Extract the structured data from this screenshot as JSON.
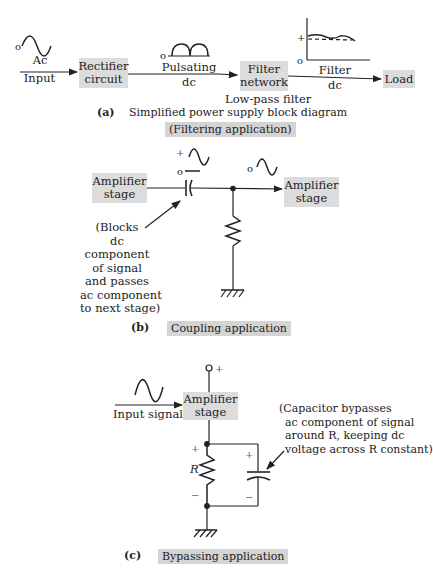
{
  "panel_a": {
    "input_label_1": "Ac",
    "input_label_2": "Input",
    "rectifier_1": "Rectifier",
    "rectifier_2": "circuit",
    "pulsating_1": "Pulsating",
    "pulsating_2": "dc",
    "filter_1": "Filter",
    "filter_2": "network",
    "filter_sub": "Low-pass filter",
    "filter_dc_1": "Filter",
    "filter_dc_2": "dc",
    "load": "Load",
    "zero": "o",
    "plus": "+",
    "letter": "(a)",
    "caption": "Simplified power supply block diagram",
    "caption_highlight": "(Filtering application)"
  },
  "panel_b": {
    "amp_left_1": "Amplifier",
    "amp_left_2": "stage",
    "amp_right_1": "Amplifier",
    "amp_right_2": "stage",
    "note": [
      "(Blocks",
      "dc",
      "component",
      "of signal",
      "and passes",
      "ac component",
      "to next stage)"
    ],
    "plus": "+",
    "zero": "o",
    "letter": "(b)",
    "caption": "Coupling application"
  },
  "panel_c": {
    "input": "Input signal",
    "amp_1": "Amplifier",
    "amp_2": "stage",
    "resistor": "R",
    "plus": "+",
    "minus": "−",
    "note": [
      "(Capacitor bypasses",
      "ac component of signal",
      "around R, keeping dc",
      "voltage across R constant)"
    ],
    "letter": "(c)",
    "caption": "Bypassing application"
  }
}
